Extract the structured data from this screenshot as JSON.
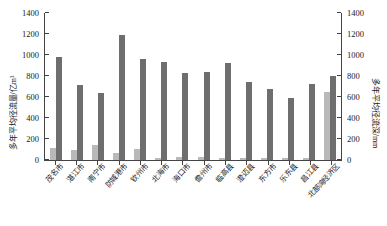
{
  "chart_data": {
    "type": "bar",
    "title": "",
    "subtitle": "",
    "xlabel": "",
    "ylabel": "多年平均径流量/亿m³",
    "y2label": "多年平均径流深/mm",
    "ylim": [
      0,
      1400
    ],
    "y2lim": [
      0,
      1400
    ],
    "yticks": [
      0,
      200,
      400,
      600,
      800,
      1000,
      1200,
      1400
    ],
    "y2ticks": [
      0,
      200,
      400,
      600,
      800,
      1000,
      1200,
      1400
    ],
    "grid": false,
    "legend": "none",
    "categories": [
      "茂名市",
      "湛江市",
      "南宁市",
      "防城港市",
      "钦州市",
      "北海市",
      "海口市",
      "儋州市",
      "临高县",
      "澄迈县",
      "东方市",
      "乐东县",
      "昌江县",
      "北部湾经济区"
    ],
    "series": [
      {
        "name": "多年平均径流量/亿m³",
        "axis": "left",
        "color": "#b9b9b9",
        "values": [
          110,
          95,
          140,
          70,
          105,
          22,
          30,
          25,
          18,
          20,
          15,
          18,
          22,
          650
        ]
      },
      {
        "name": "多年平均径流深/mm",
        "axis": "right",
        "color": "#6e6e6e",
        "values": [
          980,
          715,
          640,
          1190,
          965,
          935,
          825,
          835,
          925,
          745,
          680,
          595,
          725,
          800
        ]
      }
    ]
  }
}
